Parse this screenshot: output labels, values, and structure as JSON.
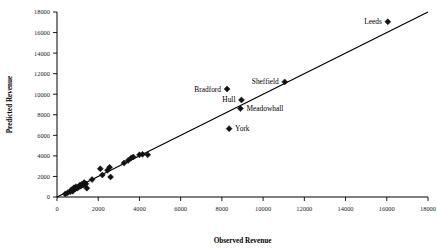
{
  "chart_data": {
    "type": "scatter",
    "title": "",
    "xlabel": "Observed Revenue",
    "ylabel": "Predicted Revenue",
    "xlim": [
      0,
      18000
    ],
    "ylim": [
      0,
      18000
    ],
    "xticks": [
      0,
      2000,
      4000,
      6000,
      8000,
      10000,
      12000,
      14000,
      16000,
      18000
    ],
    "yticks": [
      0,
      2000,
      4000,
      6000,
      8000,
      10000,
      12000,
      14000,
      16000,
      18000
    ],
    "xtick_labels": [
      "0",
      "2000",
      "4000",
      "6000",
      "8000",
      "10000",
      "12000",
      "14000",
      "16000",
      "18000"
    ],
    "ytick_labels": [
      "0",
      "2000",
      "4000",
      "6000",
      "8000",
      "10000",
      "12000",
      "14000",
      "16000",
      "18000"
    ],
    "grid": false,
    "legend": false,
    "marker": "diamond",
    "marker_color": "#121212",
    "reference_line": {
      "type": "identity",
      "from": [
        0,
        0
      ],
      "to": [
        18000,
        18000
      ]
    },
    "points": [
      {
        "x": 400,
        "y": 300,
        "label": ""
      },
      {
        "x": 520,
        "y": 420,
        "label": ""
      },
      {
        "x": 640,
        "y": 520,
        "label": ""
      },
      {
        "x": 700,
        "y": 700,
        "label": ""
      },
      {
        "x": 760,
        "y": 560,
        "label": ""
      },
      {
        "x": 820,
        "y": 900,
        "label": ""
      },
      {
        "x": 880,
        "y": 780,
        "label": ""
      },
      {
        "x": 920,
        "y": 1000,
        "label": ""
      },
      {
        "x": 980,
        "y": 860,
        "label": ""
      },
      {
        "x": 1040,
        "y": 950,
        "label": ""
      },
      {
        "x": 1100,
        "y": 1150,
        "label": ""
      },
      {
        "x": 1150,
        "y": 1050,
        "label": ""
      },
      {
        "x": 1200,
        "y": 1250,
        "label": ""
      },
      {
        "x": 1260,
        "y": 1150,
        "label": ""
      },
      {
        "x": 1320,
        "y": 1400,
        "label": ""
      },
      {
        "x": 1360,
        "y": 1200,
        "label": ""
      },
      {
        "x": 1400,
        "y": 1300,
        "label": ""
      },
      {
        "x": 1450,
        "y": 850,
        "label": ""
      },
      {
        "x": 1700,
        "y": 1700,
        "label": ""
      },
      {
        "x": 2100,
        "y": 2750,
        "label": ""
      },
      {
        "x": 2200,
        "y": 2150,
        "label": ""
      },
      {
        "x": 2450,
        "y": 2600,
        "label": ""
      },
      {
        "x": 2550,
        "y": 2900,
        "label": ""
      },
      {
        "x": 2600,
        "y": 1950,
        "label": ""
      },
      {
        "x": 3250,
        "y": 3300,
        "label": ""
      },
      {
        "x": 3450,
        "y": 3550,
        "label": ""
      },
      {
        "x": 3600,
        "y": 3800,
        "label": ""
      },
      {
        "x": 3700,
        "y": 3900,
        "label": ""
      },
      {
        "x": 4000,
        "y": 4100,
        "label": ""
      },
      {
        "x": 4150,
        "y": 4150,
        "label": ""
      },
      {
        "x": 4400,
        "y": 4100,
        "label": ""
      },
      {
        "x": 8250,
        "y": 10500,
        "label": "Bradford"
      },
      {
        "x": 8350,
        "y": 6650,
        "label": "York"
      },
      {
        "x": 8950,
        "y": 9450,
        "label": "Hull"
      },
      {
        "x": 8900,
        "y": 8600,
        "label": "Meadowhall"
      },
      {
        "x": 11050,
        "y": 11200,
        "label": "Sheffield"
      },
      {
        "x": 16050,
        "y": 17050,
        "label": "Leeds"
      }
    ],
    "annotations": [
      {
        "text": "Bradford",
        "point_x": 8250,
        "point_y": 10500,
        "side": "left"
      },
      {
        "text": "Hull",
        "point_x": 8950,
        "point_y": 9450,
        "side": "left"
      },
      {
        "text": "Meadowhall",
        "point_x": 8900,
        "point_y": 8600,
        "side": "right"
      },
      {
        "text": "York",
        "point_x": 8350,
        "point_y": 6650,
        "side": "right"
      },
      {
        "text": "Sheffield",
        "point_x": 11050,
        "point_y": 11200,
        "side": "left"
      },
      {
        "text": "Leeds",
        "point_x": 16050,
        "point_y": 17050,
        "side": "left"
      }
    ]
  }
}
